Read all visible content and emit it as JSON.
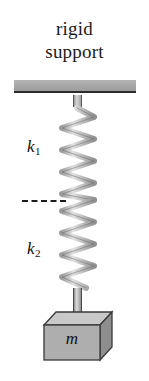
{
  "figure": {
    "type": "physics-diagram",
    "support": {
      "label_line1": "rigid",
      "label_line2": "support",
      "bar_color": "#a6a6a6",
      "bar_edge_color": "#2a2a2a"
    },
    "springs": [
      {
        "id": "upper",
        "label": "k",
        "subscript": "1",
        "stiffness_symbol": "k₁"
      },
      {
        "id": "lower",
        "label": "k",
        "subscript": "2",
        "stiffness_symbol": "k₂"
      }
    ],
    "divider": {
      "style": "dashed",
      "color": "#1c1c1c",
      "name": "spring-junction-marker"
    },
    "mass": {
      "label": "m",
      "top_face_color": "#c9c9c9",
      "front_face_color": "#aeaeae",
      "side_face_color": "#8e8e8e",
      "outline_color": "#3a3a3a"
    },
    "connectors": {
      "top_stub_color": "#b0b0b0",
      "bottom_rod_color": "#b0b0b0"
    },
    "spring_color": "#c2c2c2",
    "spring_outline_color": "#6b6b6b",
    "background_color": "#ffffff"
  }
}
